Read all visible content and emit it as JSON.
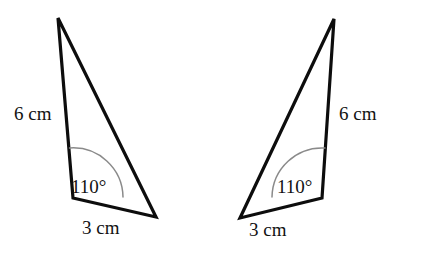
{
  "figure": {
    "background_color": "#ffffff",
    "stroke_color": "#0d0d0d",
    "arc_color": "#8a8a8a",
    "text_color": "#121212",
    "shapes": [
      {
        "id": "left-triangle",
        "orientation": "original",
        "vertices": {
          "apex": [
            58,
            18
          ],
          "angle_vertex": [
            73,
            198
          ],
          "base_end": [
            156,
            217
          ]
        },
        "path": "M 58 18 L 73 198 L 156 217 Z",
        "arc_path": "M 69.5 148 A 50 50 0 0 1 123 197",
        "labels": {
          "side_long": {
            "text": "6 cm",
            "x": 14,
            "y": 120,
            "anchor": "start"
          },
          "angle": {
            "text": "110°",
            "x": 71,
            "y": 193,
            "anchor": "start"
          },
          "side_short": {
            "text": "3 cm",
            "x": 82,
            "y": 234,
            "anchor": "start"
          }
        }
      },
      {
        "id": "right-triangle",
        "orientation": "mirrored",
        "vertices": {
          "apex": [
            334,
            19
          ],
          "angle_vertex": [
            322,
            198
          ],
          "base_end": [
            240,
            218
          ]
        },
        "path": "M 334 19 L 322 198 L 240 218 Z",
        "arc_path": "M 272 197 A 50 50 0 0 1 325 148",
        "labels": {
          "side_long": {
            "text": "6 cm",
            "x": 339,
            "y": 120,
            "anchor": "start"
          },
          "angle": {
            "text": "110°",
            "x": 277,
            "y": 193,
            "anchor": "start"
          },
          "side_short": {
            "text": "3 cm",
            "x": 249,
            "y": 236,
            "anchor": "start"
          }
        }
      }
    ],
    "measurements": {
      "long_side_label": "6 cm",
      "short_side_label": "3 cm",
      "angle_label": "110°",
      "long_side_value": 6,
      "short_side_value": 3,
      "angle_value": 110,
      "length_unit": "cm",
      "angle_unit": "degrees"
    }
  }
}
